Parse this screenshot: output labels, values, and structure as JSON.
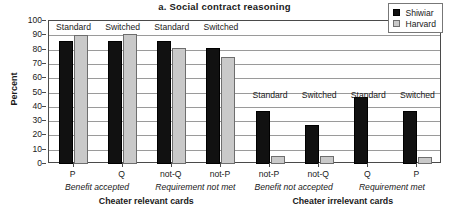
{
  "chart_data": {
    "type": "bar",
    "title": "a.  Social contract reasoning",
    "xlabel": "",
    "ylabel": "Percent",
    "ylim": [
      0,
      100
    ],
    "ytick_step": 10,
    "yticks": [
      "100",
      "90",
      "80",
      "70",
      "60",
      "50",
      "40",
      "30",
      "20",
      "10",
      "0"
    ],
    "grid": true,
    "legend_position": "top-right",
    "categories": [
      "P",
      "Q",
      "not-Q",
      "not-P",
      "not-P",
      "not-Q",
      "Q",
      "P"
    ],
    "series": [
      {
        "name": "Shiwiar",
        "color": "#111111",
        "values": [
          86,
          86,
          86,
          81,
          37,
          27.5,
          47,
          37
        ]
      },
      {
        "name": "Harvard",
        "color": "#c9c9c9",
        "values": [
          90,
          91,
          81,
          74.5,
          5.5,
          5.5,
          0,
          5
        ]
      }
    ],
    "bar_annotations": [
      {
        "label": "Standard",
        "category_index": 0
      },
      {
        "label": "Switched",
        "category_index": 1
      },
      {
        "label": "Standard",
        "category_index": 2
      },
      {
        "label": "Switched",
        "category_index": 3
      },
      {
        "label": "Standard",
        "category_index": 4
      },
      {
        "label": "Switched",
        "category_index": 5
      },
      {
        "label": "Standard",
        "category_index": 6
      },
      {
        "label": "Switched",
        "category_index": 7
      }
    ],
    "subgroups": [
      {
        "label": "Benefit accepted",
        "categories": [
          "P",
          "Q"
        ]
      },
      {
        "label": "Requirement not met",
        "categories": [
          "not-Q",
          "not-P"
        ]
      },
      {
        "label": "Benefit not accepted",
        "categories": [
          "not-P",
          "not-Q"
        ]
      },
      {
        "label": "Requirement met",
        "categories": [
          "Q",
          "P"
        ]
      }
    ],
    "groups": [
      {
        "label": "Cheater relevant cards",
        "categories": [
          "P",
          "Q",
          "not-Q",
          "not-P"
        ]
      },
      {
        "label": "Cheater irrelevant cards",
        "categories": [
          "not-P",
          "not-Q",
          "Q",
          "P"
        ]
      }
    ]
  },
  "legend": {
    "items": [
      {
        "label": "Shiwiar",
        "color": "#111111"
      },
      {
        "label": "Harvard",
        "color": "#c9c9c9"
      }
    ]
  }
}
